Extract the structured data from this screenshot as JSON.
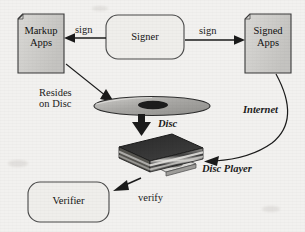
{
  "diagram": {
    "background_color": "#f2f1ef",
    "ink_color": "#1b1b1b",
    "node_fill": "#d4d3d1",
    "box_fill": "#eceae7",
    "nodes": [
      {
        "id": "markup-apps",
        "shape": "document",
        "label": "Markup\nApps",
        "fill": "#cfcecb"
      },
      {
        "id": "signer",
        "shape": "rounded-rect",
        "label": "Signer",
        "fill": "#efeeeb"
      },
      {
        "id": "signed-apps",
        "shape": "document",
        "label": "Signed\nApps",
        "fill": "#cfcecb"
      },
      {
        "id": "disc",
        "shape": "disc",
        "label": "Disc",
        "fill": "#b9b8b5"
      },
      {
        "id": "disc-player",
        "shape": "disc-player",
        "label": "Disc Player",
        "fill": "#2b2b2b"
      },
      {
        "id": "verifier",
        "shape": "rounded-rect",
        "label": "Verifier",
        "fill": "#efeeeb"
      }
    ],
    "edges": [
      {
        "id": "signer-to-markup",
        "label": "sign",
        "from": "signer",
        "to": "markup-apps",
        "style": "straight-arrow",
        "direction": "left"
      },
      {
        "id": "signer-to-signed",
        "label": "sign",
        "from": "signer",
        "to": "signed-apps",
        "style": "straight-arrow",
        "direction": "right"
      },
      {
        "id": "signer-to-disc",
        "label": "Resides\non Disc",
        "from": "signer",
        "to": "disc",
        "style": "straight-arrow",
        "direction": "down-left"
      },
      {
        "id": "disc-to-player",
        "label": "Disc",
        "from": "disc",
        "to": "disc-player",
        "style": "thick-arrow",
        "direction": "down"
      },
      {
        "id": "signed-to-player",
        "label": "Internet",
        "from": "signed-apps",
        "to": "disc-player",
        "style": "curved-arrow",
        "direction": "down-left"
      },
      {
        "id": "player-to-verifier",
        "label": "verify",
        "from": "disc-player",
        "to": "verifier",
        "style": "straight-arrow",
        "direction": "down-left"
      }
    ],
    "labels": {
      "sign_left": "sign",
      "sign_right": "sign",
      "resides_on_disc": "Resides\non Disc",
      "disc": "Disc",
      "internet": "Internet",
      "disc_player": "Disc Player",
      "verify": "verify",
      "markup_apps": "Markup\nApps",
      "signer": "Signer",
      "signed_apps": "Signed\nApps",
      "verifier": "Verifier"
    }
  }
}
